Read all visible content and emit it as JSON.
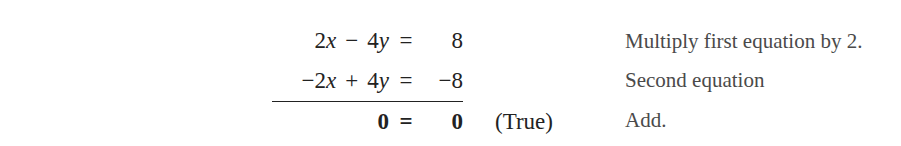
{
  "equations": [
    {
      "lhs": [
        {
          "coef": "2",
          "var": "x"
        },
        {
          "op": "−"
        },
        {
          "coef": "4",
          "var": "y"
        }
      ],
      "eq": "=",
      "rhs": "8",
      "note": "",
      "comment": "Multiply first equation by 2.",
      "bold": false,
      "underlined": false
    },
    {
      "lhs": [
        {
          "coef": "−2",
          "var": "x"
        },
        {
          "op": "+"
        },
        {
          "coef": "4",
          "var": "y"
        }
      ],
      "eq": "=",
      "rhs": "−8",
      "note": "",
      "comment": "Second equation",
      "bold": false,
      "underlined": true
    },
    {
      "lhs_text": "0",
      "eq": "=",
      "rhs": "0",
      "note": "(True)",
      "comment": "Add.",
      "bold": true,
      "underlined": false
    }
  ],
  "colors": {
    "text": "#222222",
    "comment_text": "#4a4a4a",
    "background": "#ffffff"
  }
}
